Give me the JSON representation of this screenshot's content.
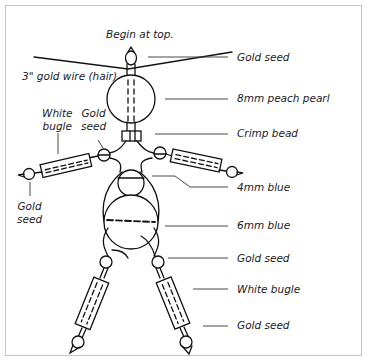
{
  "diagram": {
    "title_note": "Begin at top.",
    "left_labels": {
      "hair": "3\" gold wire (hair)",
      "arm_bugle_line1": "White",
      "arm_bugle_line2": "bugle",
      "arm_seed_line1": "Gold",
      "arm_seed_line2": "seed",
      "hand_seed_line1": "Gold",
      "hand_seed_line2": "seed"
    },
    "right_labels": [
      {
        "text": "Gold seed"
      },
      {
        "text": "8mm peach pearl"
      },
      {
        "text": "Crimp bead"
      },
      {
        "text": "4mm blue"
      },
      {
        "text": "6mm blue"
      },
      {
        "text": "Gold seed"
      },
      {
        "text": "White bugle"
      },
      {
        "text": "Gold seed"
      }
    ],
    "colors": {
      "line": "#111111",
      "leader": "#333333",
      "frame": "#c4c4c4",
      "background": "#ffffff"
    }
  }
}
